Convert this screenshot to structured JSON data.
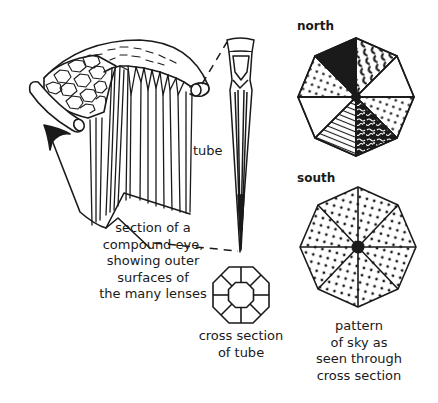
{
  "diagram": {
    "labels": {
      "tube": "tube",
      "north": "north",
      "south": "south",
      "eye_caption": [
        "section of a",
        "compound eye,",
        "showing outer",
        "surfaces of",
        "the many lenses"
      ],
      "cross_section_caption": [
        "cross section",
        "of tube"
      ],
      "sky_caption": [
        "pattern",
        "of sky as",
        "seen through",
        "cross section"
      ]
    },
    "colors": {
      "ink": "#1a1a1a",
      "background": "#ffffff"
    },
    "north_pattern_segments": [
      "solid-black",
      "crescents",
      "blank",
      "dots",
      "squiggles",
      "hatched-lines",
      "blank",
      "dots"
    ],
    "south_pattern_segments": [
      "dots",
      "dots",
      "dots",
      "dots",
      "dots",
      "dots",
      "dots",
      "dots"
    ]
  }
}
